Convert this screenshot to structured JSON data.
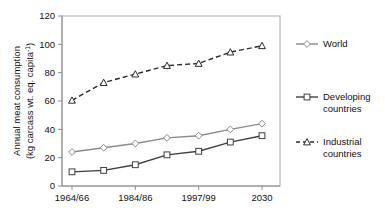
{
  "chart_data": {
    "type": "line",
    "title": "",
    "xlabel": "",
    "ylabel_line1": "Annual meat consumption",
    "ylabel_line2": "(kg carcass wt. eq. capita",
    "ylabel_sup": "-1",
    "ylabel_close": ")",
    "ylim": [
      0,
      120
    ],
    "yticks": [
      0,
      20,
      40,
      60,
      80,
      100,
      120
    ],
    "ytick_labels": [
      "0",
      "20",
      "40",
      "60",
      "80",
      "100",
      "120"
    ],
    "x_positions": [
      0,
      1,
      2,
      3,
      4,
      5,
      6
    ],
    "xtick_positions": [
      0,
      2,
      4,
      6
    ],
    "xtick_labels": [
      "1964/66",
      "1984/86",
      "1997/99",
      "2030"
    ],
    "grid": false,
    "legend_position": "right",
    "series": [
      {
        "name": "World",
        "values": [
          24,
          27,
          30,
          34,
          35.5,
          40,
          44
        ],
        "color": "#8a8a8a",
        "marker": "diamond",
        "linestyle": "solid"
      },
      {
        "name": "Developing countries",
        "values": [
          10,
          11,
          15,
          22,
          24.5,
          31,
          35.5
        ],
        "color": "#3f3f3f",
        "marker": "square",
        "linestyle": "solid"
      },
      {
        "name": "Industrial countries",
        "values": [
          60.5,
          73,
          79,
          85,
          86.5,
          94.5,
          99
        ],
        "color": "#2b2b2b",
        "marker": "triangle",
        "linestyle": "dashed"
      }
    ]
  },
  "legend": {
    "entries": [
      {
        "label": "World",
        "label_line2": ""
      },
      {
        "label": "Developing",
        "label_line2": "countries"
      },
      {
        "label": "Industrial",
        "label_line2": "countries"
      }
    ]
  },
  "colors": {
    "world": "#8a8a8a",
    "developing": "#3f3f3f",
    "industrial": "#2b2b2b",
    "axis": "#999999",
    "text": "#111111",
    "background": "#ffffff"
  }
}
